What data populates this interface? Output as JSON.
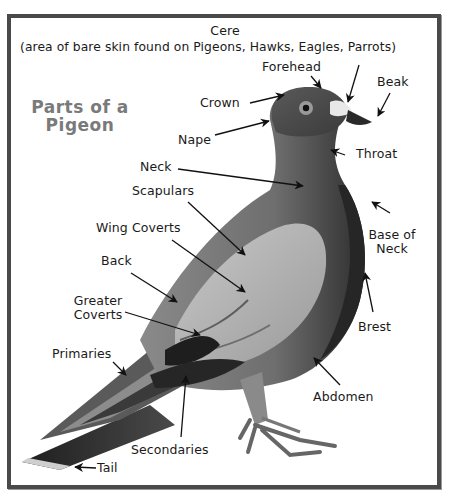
{
  "title": {
    "line1": "Parts of a",
    "line2": "Pigeon",
    "color": "#7a7a7a"
  },
  "frame": {
    "border_color": "#4a4a4a"
  },
  "labels": {
    "cere": "Cere",
    "cere_note": "(area of bare skin found on Pigeons, Hawks, Eagles, Parrots)",
    "forehead": "Forehead",
    "beak": "Beak",
    "crown": "Crown",
    "nape": "Nape",
    "throat": "Throat",
    "neck": "Neck",
    "scapulars": "Scapulars",
    "wing_coverts": "Wing Coverts",
    "base_of_neck_1": "Base of",
    "base_of_neck_2": "Neck",
    "back": "Back",
    "greater_coverts_1": "Greater",
    "greater_coverts_2": "Coverts",
    "brest": "Brest",
    "primaries": "Primaries",
    "abdomen": "Abdomen",
    "secondaries": "Secondaries",
    "tail": "Tail"
  },
  "illustration": {
    "subject": "pigeon-side-view",
    "palette": [
      "#2a2a2a",
      "#555555",
      "#7d7d7d",
      "#a8a8a8",
      "#d6d6d6"
    ]
  }
}
